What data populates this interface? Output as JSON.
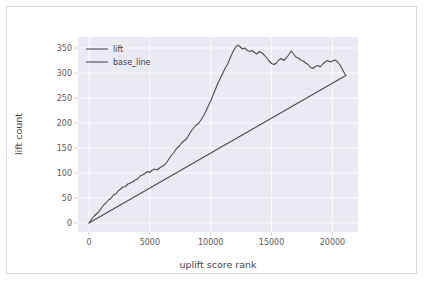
{
  "figure": {
    "width": 424,
    "height": 281,
    "background_color": "#ffffff",
    "border_color": "#d8d8d8",
    "plot_background_color": "#eaeaf2",
    "grid_color": "#ffffff",
    "line_color": "#4a4a52"
  },
  "chart_data": {
    "type": "line",
    "title": "",
    "xlabel": "uplift score rank",
    "ylabel": "lift count",
    "xlim": [
      -900,
      22100
    ],
    "ylim": [
      -18,
      372
    ],
    "xticks": [
      0,
      5000,
      10000,
      15000,
      20000
    ],
    "xtick_labels": [
      "0",
      "5000",
      "10000",
      "15000",
      "20000"
    ],
    "yticks": [
      0,
      50,
      100,
      150,
      200,
      250,
      300,
      350
    ],
    "ytick_labels": [
      "0",
      "50",
      "100",
      "150",
      "200",
      "250",
      "300",
      "350"
    ],
    "grid": true,
    "legend_position": "upper left",
    "legend_frame": false,
    "series": [
      {
        "name": "lift",
        "color": "#4a4a52",
        "x": [
          0,
          200,
          400,
          600,
          800,
          1000,
          1200,
          1400,
          1600,
          1800,
          2000,
          2200,
          2400,
          2600,
          2800,
          3000,
          3200,
          3400,
          3600,
          3800,
          4000,
          4200,
          4400,
          4600,
          4800,
          5000,
          5200,
          5400,
          5600,
          5800,
          6000,
          6200,
          6400,
          6600,
          6800,
          7000,
          7200,
          7400,
          7600,
          7800,
          8000,
          8200,
          8400,
          8600,
          8800,
          9000,
          9200,
          9400,
          9600,
          9800,
          10000,
          10200,
          10400,
          10600,
          10800,
          11000,
          11200,
          11400,
          11600,
          11800,
          12000,
          12200,
          12400,
          12600,
          12800,
          13000,
          13200,
          13400,
          13600,
          13800,
          14000,
          14200,
          14400,
          14600,
          14800,
          15000,
          15200,
          15400,
          15600,
          15800,
          16000,
          16200,
          16400,
          16600,
          16800,
          17000,
          17200,
          17400,
          17600,
          17800,
          18000,
          18200,
          18400,
          18600,
          18800,
          19000,
          19200,
          19400,
          19600,
          19800,
          20000,
          20200,
          20400,
          20600,
          20800,
          21000,
          21100
        ],
        "y": [
          0,
          7,
          13,
          18,
          22,
          29,
          36,
          40,
          46,
          49,
          56,
          58,
          64,
          68,
          72,
          73,
          78,
          80,
          82,
          86,
          88,
          94,
          96,
          99,
          103,
          101,
          106,
          108,
          106,
          110,
          113,
          116,
          122,
          129,
          136,
          142,
          149,
          153,
          160,
          164,
          168,
          176,
          184,
          190,
          196,
          199,
          206,
          214,
          223,
          234,
          244,
          256,
          268,
          280,
          290,
          300,
          310,
          318,
          330,
          341,
          350,
          356,
          353,
          348,
          350,
          345,
          343,
          345,
          341,
          338,
          343,
          340,
          336,
          330,
          324,
          319,
          317,
          320,
          326,
          329,
          325,
          330,
          336,
          344,
          338,
          332,
          330,
          326,
          324,
          320,
          317,
          311,
          309,
          313,
          315,
          312,
          318,
          322,
          325,
          322,
          324,
          326,
          323,
          317,
          308,
          299,
          295
        ]
      },
      {
        "name": "base_line",
        "color": "#4a4a52",
        "x": [
          0,
          21100
        ],
        "y": [
          0,
          295
        ]
      }
    ],
    "legend_entries": [
      {
        "label": "lift",
        "color": "#4a4a52"
      },
      {
        "label": "base_line",
        "color": "#4a4a52"
      }
    ],
    "annotations": {
      "peak_value": 357,
      "peak_rank": 11900,
      "end_value": 295,
      "end_rank": 21100
    }
  }
}
